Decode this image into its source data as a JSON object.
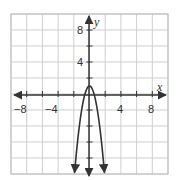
{
  "chart_data": {
    "type": "line",
    "title": "",
    "xlabel": "x",
    "ylabel": "y",
    "xlim": [
      -10,
      10
    ],
    "ylim": [
      -10,
      10
    ],
    "grid": true,
    "grid_step": 2,
    "x_tick_labels": [
      "-8",
      "-4",
      "4",
      "8"
    ],
    "x_ticks": [
      -8,
      -4,
      4,
      8
    ],
    "y_tick_labels": [
      "8",
      "4"
    ],
    "y_ticks": [
      8,
      4
    ],
    "series": [
      {
        "name": "parabola",
        "equation": "y = -3x^2 + 1",
        "vertex": [
          0,
          1
        ],
        "opens": "down",
        "end_arrows": true,
        "x": [
          -1.9,
          -1.5,
          -1,
          -0.5,
          0,
          0.5,
          1,
          1.5,
          1.9
        ],
        "y": [
          -9.83,
          -5.75,
          -2,
          0.25,
          1,
          0.25,
          -2,
          -5.75,
          -9.83
        ]
      }
    ],
    "legend": null
  },
  "colors": {
    "grid": "#cfcfcf",
    "border": "#bdbdbd",
    "axis": "#333333",
    "curve": "#333333",
    "background": "#ffffff"
  },
  "labels": {
    "x_axis": "x",
    "y_axis": "y",
    "x_ticks": [
      "−8",
      "−4",
      "4",
      "8"
    ],
    "y_ticks": [
      "8",
      "4"
    ]
  }
}
